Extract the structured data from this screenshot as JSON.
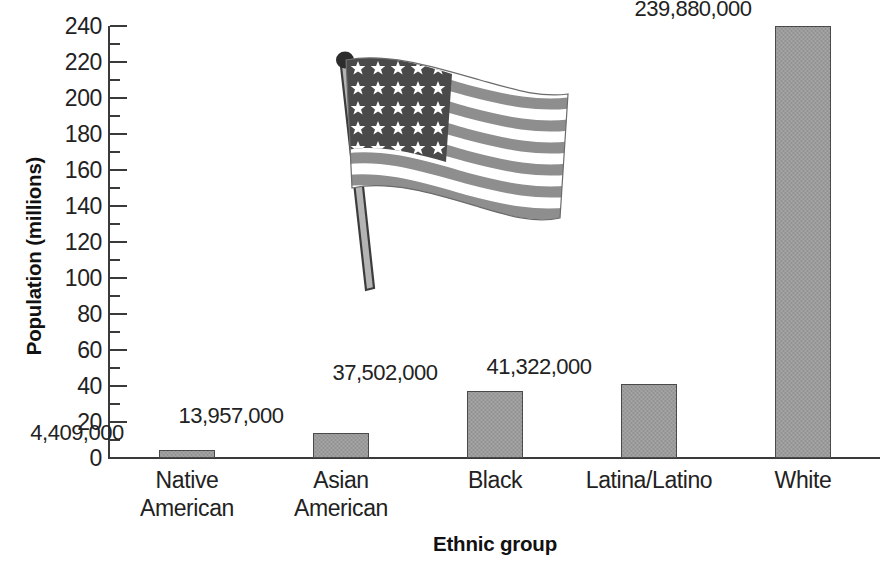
{
  "chart_data": {
    "type": "bar",
    "title": "",
    "xlabel": "Ethnic group",
    "ylabel": "Population (millions)",
    "categories": [
      "Native American",
      "Asian American",
      "Black",
      "Latina/Latino",
      "White"
    ],
    "values": [
      4.409,
      13.957,
      37.502,
      41.322,
      239.88
    ],
    "value_labels": [
      "4,409,000",
      "13,957,000",
      "37,502,000",
      "41,322,000",
      "239,880,000"
    ],
    "ylim": [
      0,
      240
    ],
    "y_major_step": 20,
    "y_minor_step": 10,
    "y_ticks": [
      "240",
      "220",
      "200",
      "180",
      "160",
      "140",
      "120",
      "100",
      "80",
      "60",
      "40",
      "20",
      "0"
    ],
    "grid": false,
    "legend": "none",
    "bar_color": "#9a9a9a",
    "bar_border_color": "#4a4a4a",
    "axis_color": "#3a3a3a",
    "text_color": "#222222"
  },
  "axes": {
    "y_title": "Population (millions)",
    "x_title": "Ethnic group"
  },
  "ticks": [
    {
      "label": "240",
      "value": 240
    },
    {
      "label": "220",
      "value": 220
    },
    {
      "label": "200",
      "value": 200
    },
    {
      "label": "180",
      "value": 180
    },
    {
      "label": "160",
      "value": 160
    },
    {
      "label": "140",
      "value": 140
    },
    {
      "label": "120",
      "value": 120
    },
    {
      "label": "100",
      "value": 100
    },
    {
      "label": "80",
      "value": 80
    },
    {
      "label": "60",
      "value": 60
    },
    {
      "label": "40",
      "value": 40
    },
    {
      "label": "20",
      "value": 20
    },
    {
      "label": "0",
      "value": 0
    }
  ],
  "bars": [
    {
      "label": "Native American",
      "label_line1": "Native",
      "label_line2": "American",
      "value": 4.409,
      "value_label": "4,409,000"
    },
    {
      "label": "Asian American",
      "label_line1": "Asian",
      "label_line2": "American",
      "value": 13.957,
      "value_label": "13,957,000"
    },
    {
      "label": "Black",
      "label_line1": "Black",
      "label_line2": "",
      "value": 37.502,
      "value_label": "37,502,000"
    },
    {
      "label": "Latina/Latino",
      "label_line1": "Latina/Latino",
      "label_line2": "",
      "value": 41.322,
      "value_label": "41,322,000"
    },
    {
      "label": "White",
      "label_line1": "White",
      "label_line2": "",
      "value": 239.88,
      "value_label": "239,880,000"
    }
  ],
  "decoration": {
    "flag_icon": "usa-flag-icon",
    "flag_description": "Waving United States flag on a pole, grayscale"
  }
}
